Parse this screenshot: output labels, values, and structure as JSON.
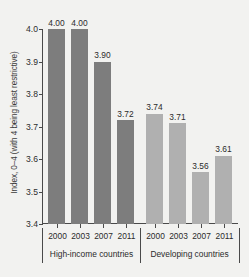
{
  "chart_data": {
    "type": "bar",
    "title": "",
    "xlabel": "",
    "ylabel": "Index, 0–4 (with 4 being least restrictive)",
    "ylim": [
      3.4,
      4.0
    ],
    "yticks": [
      "3.4",
      "3.5",
      "3.6",
      "3.7",
      "3.8",
      "3.9",
      "4.0"
    ],
    "ytick_values": [
      3.4,
      3.5,
      3.6,
      3.7,
      3.8,
      3.9,
      4.0
    ],
    "grid": false,
    "legend": "none",
    "categories": [
      "2000",
      "2003",
      "2007",
      "2011"
    ],
    "groups": [
      {
        "name": "High-income countries",
        "color": "#7d7d7d",
        "categories": [
          "2000",
          "2003",
          "2007",
          "2011"
        ],
        "values": [
          4.0,
          4.0,
          3.9,
          3.72
        ],
        "labels": [
          "4.00",
          "4.00",
          "3.90",
          "3.72"
        ]
      },
      {
        "name": "Developing countries",
        "color": "#b0b0b0",
        "categories": [
          "2000",
          "2003",
          "2007",
          "2011"
        ],
        "values": [
          3.74,
          3.71,
          3.56,
          3.61
        ],
        "labels": [
          "3.74",
          "3.71",
          "3.56",
          "3.61"
        ]
      }
    ],
    "series": [
      {
        "name": "High-income countries",
        "values": [
          4.0,
          4.0,
          3.9,
          3.72
        ]
      },
      {
        "name": "Developing countries",
        "values": [
          3.74,
          3.71,
          3.56,
          3.61
        ]
      }
    ]
  },
  "colors": {
    "background": "#f2f2f0",
    "axis": "#4a4a4a",
    "text": "#2b2b2b",
    "bar_high_income": "#7d7d7d",
    "bar_developing": "#b0b0b0"
  }
}
